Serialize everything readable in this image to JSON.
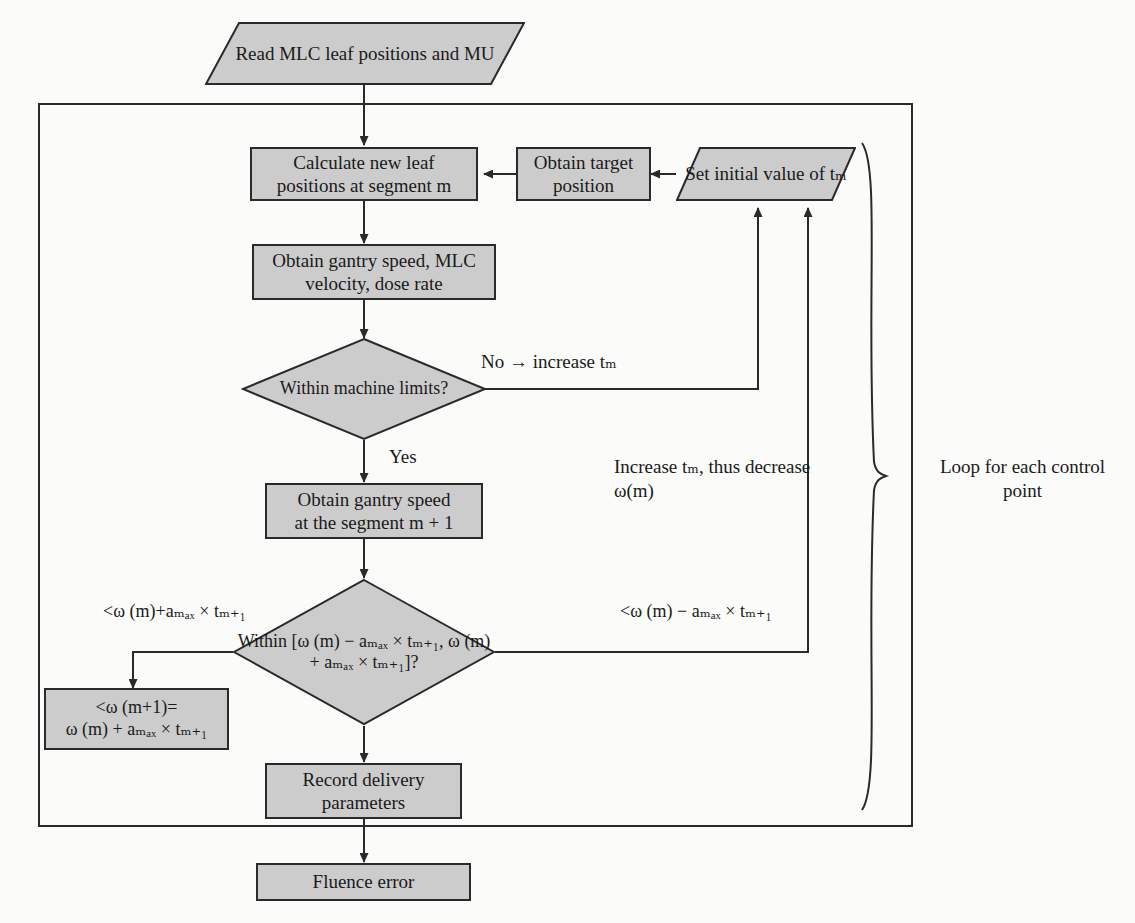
{
  "diagram": {
    "type": "flowchart",
    "fill_color": "#cccccc",
    "stroke_color": "#2a2a2a",
    "background_color": "#fbfbfa"
  },
  "nodes": {
    "read_input": {
      "shape": "parallelogram",
      "line1": "Read MLC leaf",
      "line2": "positions and MU"
    },
    "calculate_leaf": {
      "shape": "process",
      "line1": "Calculate new leaf",
      "line2": "positions at segment m"
    },
    "obtain_target": {
      "shape": "process",
      "line1": "Obtain target",
      "line2": "position"
    },
    "set_initial": {
      "shape": "parallelogram",
      "line1": "Set initial",
      "line2": "value of tₘ"
    },
    "obtain_gantry": {
      "shape": "process",
      "line1": "Obtain gantry speed, MLC",
      "line2": "velocity, dose rate"
    },
    "within_machine": {
      "shape": "decision",
      "line1": "Within",
      "line2": "machine",
      "line3": "limits?"
    },
    "obtain_gantry2": {
      "shape": "process",
      "line1": "Obtain gantry speed",
      "line2": "at the segment m + 1"
    },
    "within_range": {
      "shape": "decision",
      "line1": "Within [ω (m)",
      "line2": "− aₘₐₓ × tₘ₊₁,",
      "line3": "ω (m) + aₘₐₓ",
      "line4": "× tₘ₊₁]?"
    },
    "omega_assign": {
      "shape": "process",
      "line1": "<ω (m+1)=",
      "line2": "ω (m) + aₘₐₓ × tₘ₊₁"
    },
    "record_delivery": {
      "shape": "process",
      "line1": "Record delivery",
      "line2": "parameters"
    },
    "fluence_error": {
      "shape": "process",
      "line1": "Fluence error"
    }
  },
  "edge_labels": {
    "no_increase": "No → increase tₘ",
    "yes": "Yes",
    "increase_tm_line1": "Increase tₘ,",
    "increase_tm_line2": "thus decrease ω(m)",
    "left_branch": "<ω (m)+aₘₐₓ × tₘ₊₁",
    "right_branch": "<ω (m) − aₘₐₓ × tₘ₊₁",
    "loop_note_line1": "Loop for each control",
    "loop_note_line2": "point"
  }
}
